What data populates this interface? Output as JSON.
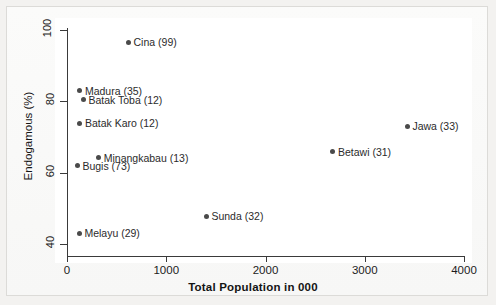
{
  "chart_data": {
    "type": "scatter",
    "title": "",
    "xlabel": "Total Population in 000",
    "ylabel": "Endogamous (%)",
    "xlim": [
      0,
      4000
    ],
    "ylim": [
      35,
      103
    ],
    "xticks": [
      0,
      1000,
      2000,
      3000,
      4000
    ],
    "xtick_labels": [
      "0",
      "1000",
      "2000",
      "3000",
      "4000"
    ],
    "yticks": [
      40,
      60,
      80,
      100
    ],
    "ytick_labels": [
      "40",
      "60",
      "80",
      "100"
    ],
    "grid": false,
    "legend": "none",
    "marker_color": "#4a4a4a",
    "points": [
      {
        "name": "Cina",
        "count": 99,
        "label": "Cina (99)",
        "x": 620,
        "y": 96.5,
        "label_side": "right"
      },
      {
        "name": "Madura",
        "count": 35,
        "label": "Madura (35)",
        "x": 130,
        "y": 83.0,
        "label_side": "right"
      },
      {
        "name": "Batak Toba",
        "count": 12,
        "label": "Batak Toba (12)",
        "x": 165,
        "y": 80.4,
        "label_side": "right"
      },
      {
        "name": "Batak Karo",
        "count": 12,
        "label": "Batak Karo (12)",
        "x": 130,
        "y": 73.8,
        "label_side": "right"
      },
      {
        "name": "Minangkabau",
        "count": 13,
        "label": "Minangkabau (13)",
        "x": 320,
        "y": 64.2,
        "label_side": "right"
      },
      {
        "name": "Bugis",
        "count": 73,
        "label": "Bugis (73)",
        "x": 105,
        "y": 62.0,
        "label_side": "right"
      },
      {
        "name": "Sunda",
        "count": 32,
        "label": "Sunda (32)",
        "x": 1405,
        "y": 47.8,
        "label_side": "right"
      },
      {
        "name": "Melayu",
        "count": 29,
        "label": "Melayu (29)",
        "x": 125,
        "y": 43.0,
        "label_side": "right"
      },
      {
        "name": "Jawa",
        "count": 33,
        "label": "Jawa (33)",
        "x": 3430,
        "y": 73.0,
        "label_side": "right"
      },
      {
        "name": "Betawi",
        "count": 31,
        "label": "Betawi (31)",
        "x": 2680,
        "y": 65.8,
        "label_side": "right"
      }
    ]
  }
}
